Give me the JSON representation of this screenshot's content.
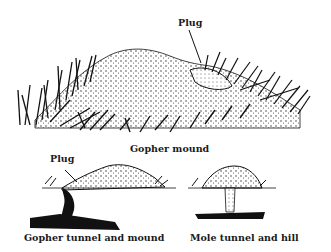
{
  "figure": {
    "main_illustration": {
      "caption": "Gopher mound",
      "callout": "Plug"
    },
    "gopher_diagram": {
      "caption": "Gopher tunnel and mound",
      "callout": "Plug"
    },
    "mole_diagram": {
      "caption": "Mole tunnel and hill"
    }
  },
  "colors": {
    "ink": "#111111",
    "background": "#ffffff"
  }
}
